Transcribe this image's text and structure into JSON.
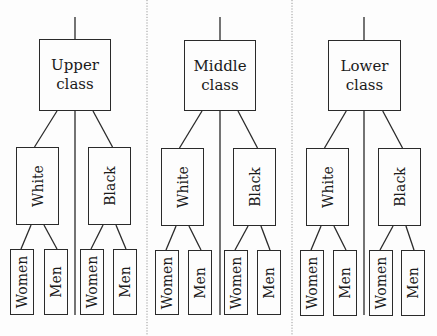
{
  "diagram": {
    "type": "hierarchy-tree",
    "groups": [
      {
        "label": "Upper\nclass",
        "box": [
          39,
          39,
          72,
          72
        ],
        "center_x": 75,
        "children": [
          {
            "label": "White",
            "box": [
              16,
              147,
              43,
              78
            ],
            "leaves": [
              {
                "label": "Women",
                "box": [
                  10,
                  249,
                  24,
                  66
                ]
              },
              {
                "label": "Men",
                "box": [
                  44,
                  249,
                  24,
                  66
                ]
              }
            ]
          },
          {
            "label": "Black",
            "box": [
              88,
              147,
              43,
              78
            ],
            "leaves": [
              {
                "label": "Women",
                "box": [
                  80,
                  249,
                  24,
                  66
                ]
              },
              {
                "label": "Men",
                "box": [
                  113,
                  249,
                  24,
                  66
                ]
              }
            ]
          }
        ]
      },
      {
        "label": "Middle\nclass",
        "box": [
          184,
          40,
          72,
          71
        ],
        "center_x": 220,
        "children": [
          {
            "label": "White",
            "box": [
              161,
              148,
              43,
              78
            ],
            "leaves": [
              {
                "label": "Women",
                "box": [
                  155,
                  250,
                  24,
                  65
                ]
              },
              {
                "label": "Men",
                "box": [
                  188,
                  250,
                  24,
                  65
                ]
              }
            ]
          },
          {
            "label": "Black",
            "box": [
              233,
              148,
              43,
              78
            ],
            "leaves": [
              {
                "label": "Women",
                "box": [
                  224,
                  250,
                  24,
                  65
                ]
              },
              {
                "label": "Men",
                "box": [
                  257,
                  250,
                  24,
                  65
                ]
              }
            ]
          }
        ]
      },
      {
        "label": "Lower\nclass",
        "box": [
          328,
          40,
          73,
          71
        ],
        "center_x": 364,
        "children": [
          {
            "label": "White",
            "box": [
              306,
              148,
              43,
              78
            ],
            "leaves": [
              {
                "label": "Women",
                "box": [
                  300,
                  250,
                  24,
                  66
                ]
              },
              {
                "label": "Men",
                "box": [
                  333,
                  250,
                  24,
                  66
                ]
              }
            ]
          },
          {
            "label": "Black",
            "box": [
              378,
              148,
              43,
              78
            ],
            "leaves": [
              {
                "label": "Women",
                "box": [
                  369,
                  250,
                  24,
                  66
                ]
              },
              {
                "label": "Men",
                "box": [
                  401,
                  250,
                  24,
                  66
                ]
              }
            ]
          }
        ]
      }
    ],
    "separators_x": [
      147,
      292
    ],
    "colors": {
      "line": "#2a2a2a",
      "separator": "#9a9a9a",
      "background": "#fdfdfd"
    }
  }
}
